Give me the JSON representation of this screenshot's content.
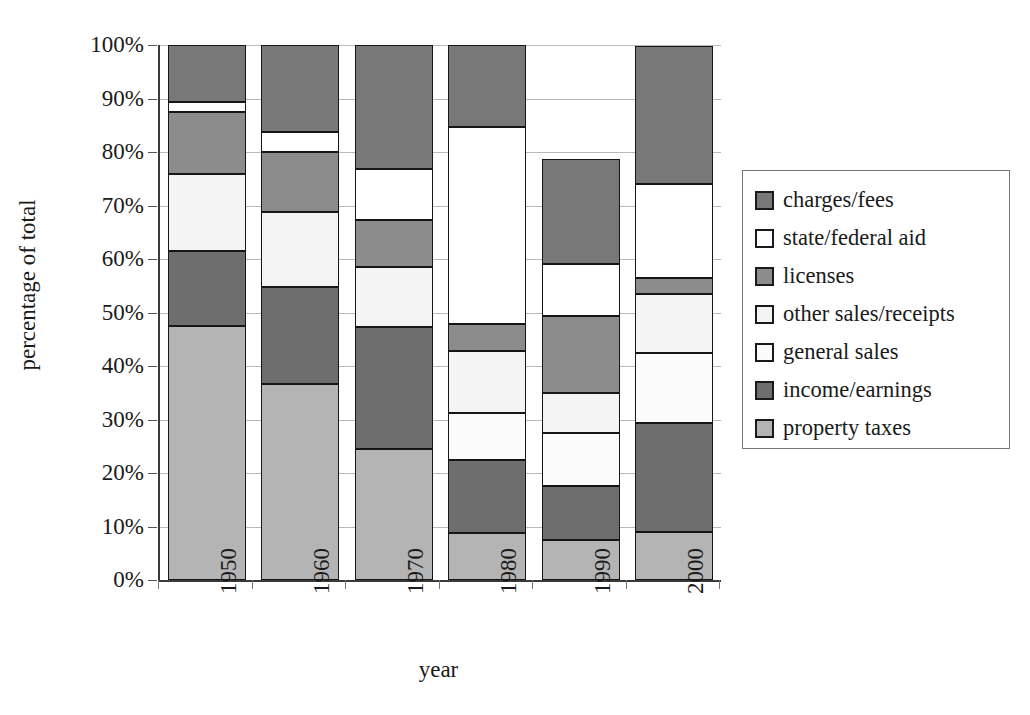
{
  "chart_data": {
    "type": "bar",
    "subtype": "stacked-percentage",
    "title": "",
    "xlabel": "year",
    "ylabel": "percentage of total",
    "categories": [
      "1950",
      "1960",
      "1970",
      "1980",
      "1990",
      "2000"
    ],
    "ylim": [
      0,
      100
    ],
    "ytick_labels": [
      "0%",
      "10%",
      "20%",
      "30%",
      "40%",
      "50%",
      "60%",
      "70%",
      "80%",
      "90%",
      "100%"
    ],
    "ytick_values": [
      0,
      10,
      20,
      30,
      40,
      50,
      60,
      70,
      80,
      90,
      100
    ],
    "grid": true,
    "legend_position": "right",
    "stack_order_bottom_to_top": [
      "property taxes",
      "income/earnings",
      "general sales",
      "other sales/receipts",
      "licenses",
      "state/federal aid",
      "charges/fees"
    ],
    "series": [
      {
        "name": "charges/fees",
        "color": "#787878",
        "values": [
          10.7,
          16.2,
          23.2,
          15.3,
          19.5,
          25.8
        ]
      },
      {
        "name": "state/federal aid",
        "color": "#ffffff",
        "values": [
          1.8,
          3.8,
          9.6,
          36.8,
          9.7,
          17.5
        ]
      },
      {
        "name": "licenses",
        "color": "#8c8c8c",
        "values": [
          11.7,
          11.2,
          8.7,
          5.1,
          14.4,
          3.0
        ]
      },
      {
        "name": "other sales/receipts",
        "color": "#f4f4f4",
        "values": [
          14.3,
          14.1,
          11.2,
          11.5,
          7.6,
          11.0
        ]
      },
      {
        "name": "general sales",
        "color": "#fbfbfb",
        "values": [
          0.0,
          0.0,
          0.0,
          8.9,
          9.8,
          13.2
        ]
      },
      {
        "name": "income/earnings",
        "color": "#6e6e6e",
        "values": [
          14.0,
          18.0,
          22.8,
          13.7,
          10.2,
          20.4
        ]
      },
      {
        "name": "property taxes",
        "color": "#b4b4b4",
        "values": [
          47.5,
          36.7,
          24.5,
          8.7,
          7.4,
          8.9
        ]
      }
    ],
    "stack_boundaries_percent": {
      "1950": [
        0,
        47.5,
        61.5,
        61.5,
        75.8,
        87.5,
        89.3,
        100
      ],
      "1960": [
        0,
        36.7,
        54.7,
        54.7,
        68.8,
        80.0,
        83.8,
        100
      ],
      "1970": [
        0,
        24.5,
        47.3,
        47.3,
        58.5,
        67.2,
        76.8,
        100
      ],
      "1980": [
        0,
        8.7,
        22.4,
        31.3,
        42.8,
        47.9,
        84.7,
        100
      ],
      "1990": [
        0,
        7.4,
        17.6,
        27.4,
        35.0,
        49.4,
        59.1,
        100
      ],
      "2000": [
        0,
        8.9,
        29.3,
        42.5,
        53.5,
        56.5,
        74.0,
        100
      ]
    }
  },
  "legend": {
    "items": [
      {
        "label": "charges/fees",
        "swatch": "#787878"
      },
      {
        "label": "state/federal aid",
        "swatch": "#ffffff"
      },
      {
        "label": "licenses",
        "swatch": "#8c8c8c"
      },
      {
        "label": "other sales/receipts",
        "swatch": "#f4f4f4"
      },
      {
        "label": "general sales",
        "swatch": "#fbfbfb"
      },
      {
        "label": "income/earnings",
        "swatch": "#6e6e6e"
      },
      {
        "label": "property taxes",
        "swatch": "#b4b4b4"
      }
    ]
  }
}
